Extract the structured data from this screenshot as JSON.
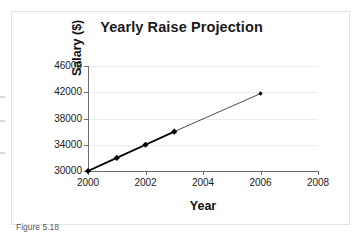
{
  "figure": {
    "caption": "Figure 5.18"
  },
  "chart_data": {
    "type": "line",
    "title": "Yearly Raise Projection",
    "xlabel": "Year",
    "ylabel": "Salary ($)",
    "xlim": [
      2000,
      2008
    ],
    "ylim": [
      30000,
      46000
    ],
    "grid": true,
    "legend": null,
    "xticks": [
      "2000",
      "2002",
      "2004",
      "2006",
      "2008"
    ],
    "xtick_values": [
      2000,
      2002,
      2004,
      2006,
      2008
    ],
    "yticks": [
      "30000",
      "34000",
      "38000",
      "42000",
      "46000"
    ],
    "ytick_values": [
      30000,
      34000,
      38000,
      42000,
      46000
    ],
    "series": [
      {
        "name": "Actual salary",
        "style": "solid-thick",
        "marker": "diamond",
        "x": [
          2000,
          2001,
          2002,
          2003
        ],
        "values": [
          30000,
          32000,
          34000,
          36000
        ]
      },
      {
        "name": "Projected salary",
        "style": "solid-thin",
        "marker": "diamond",
        "x": [
          2003,
          2006
        ],
        "values": [
          36000,
          41800
        ]
      }
    ]
  }
}
